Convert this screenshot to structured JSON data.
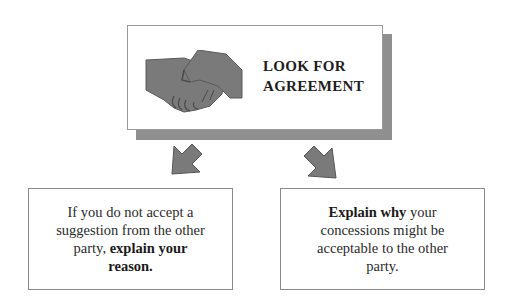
{
  "main": {
    "title_line1": "LOOK FOR",
    "title_line2": "AGREEMENT",
    "icon": "handshake-icon"
  },
  "arrows": {
    "left": "arrow-down-left-icon",
    "right": "arrow-down-right-icon"
  },
  "left_box": {
    "line1": "If you do not accept a",
    "line2": "suggestion from the other",
    "line3_plain": "party, ",
    "line3_bold": "explain your",
    "line4_bold": "reason."
  },
  "right_box": {
    "line1_bold": "Explain why",
    "line1_plain": " your",
    "line2": "concessions might be",
    "line3": "acceptable to the other",
    "line4": "party."
  },
  "colors": {
    "shape_fill": "#7a7a7a",
    "shadow": "#8f8f8f",
    "border": "#9a9a9a"
  }
}
